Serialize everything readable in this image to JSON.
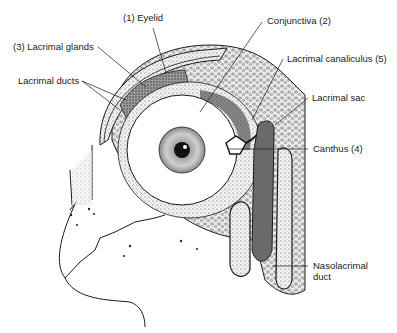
{
  "diagram": {
    "labels": [
      {
        "id": "eyelid",
        "text": "(1)  Eyelid",
        "x": 123,
        "y": 12
      },
      {
        "id": "lacrimal-glands",
        "text": "(3)  Lacrimal glands",
        "x": 13,
        "y": 41
      },
      {
        "id": "lacrimal-ducts",
        "text": "Lacrimal ducts",
        "x": 18,
        "y": 75
      },
      {
        "id": "conjunctiva",
        "text": "Conjunctiva  (2)",
        "x": 267,
        "y": 15
      },
      {
        "id": "lacrimal-canaliculus",
        "text": "Lacrimal canaliculus  (5)",
        "x": 287,
        "y": 53
      },
      {
        "id": "lacrimal-sac",
        "text": "Lacrimal sac",
        "x": 312,
        "y": 92
      },
      {
        "id": "canthus",
        "text": "Canthus (4)",
        "x": 313,
        "y": 143
      },
      {
        "id": "nasolacrimal-duct-line1",
        "text": "Nasolacrimal",
        "x": 313,
        "y": 261
      },
      {
        "id": "nasolacrimal-duct-line2",
        "text": "duct",
        "x": 313,
        "y": 273
      }
    ],
    "colors": {
      "ink": "#1a1a1a",
      "gland": "#6e6e6e",
      "bone": "#e6e6e6",
      "shade": "#8a8a8a",
      "background": "#ffffff"
    }
  }
}
